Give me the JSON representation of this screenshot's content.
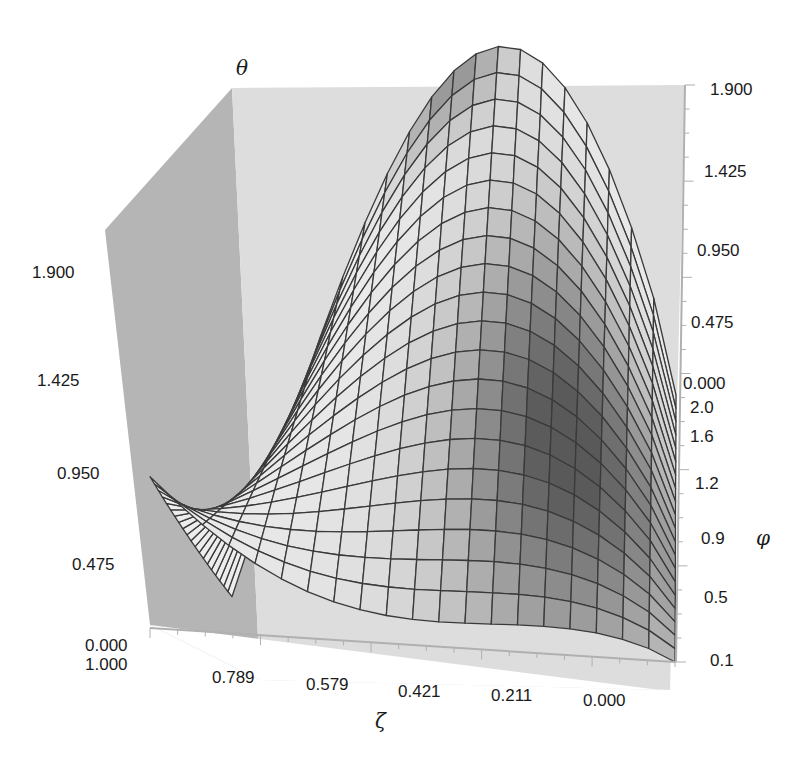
{
  "chart_data": {
    "type": "surface3d",
    "title": "",
    "axes": {
      "x": {
        "label": "ζ",
        "ticks": [
          "1.000",
          "0.789",
          "0.579",
          "0.421",
          "0.211",
          "0.000"
        ],
        "range": [
          1.0,
          0.0
        ]
      },
      "y": {
        "label": "φ",
        "ticks": [
          "0.1",
          "0.5",
          "0.9",
          "1.2",
          "1.6",
          "2.0"
        ],
        "range": [
          0.1,
          2.0
        ]
      },
      "z": {
        "label": "θ",
        "ticks": [
          "0.000",
          "0.475",
          "0.950",
          "1.425",
          "1.900"
        ],
        "range": [
          0.0,
          1.9
        ]
      }
    },
    "surface_description": "θ(ζ, φ) hump: zero-ish at ζ=0, maximum near ζ≈0.5, grows with φ; peak θ≈1.9 at φ=2.0",
    "grid": {
      "zeta_lines": 20,
      "phi_lines": 20
    },
    "sample_values": {
      "phi_2.0": {
        "zeta": [
          0.0,
          0.211,
          0.421,
          0.579,
          0.789,
          1.0
        ],
        "theta": [
          0.0,
          1.2,
          1.85,
          1.85,
          1.2,
          0.0
        ]
      },
      "phi_0.1_edge": {
        "zeta": [
          0.0,
          1.0
        ],
        "theta": [
          0.0,
          1.05
        ]
      }
    },
    "colors": {
      "back_wall": "#d9d9d9",
      "side_wall": "#b3b3b3",
      "grid_line": "#3a3a3a",
      "surface_light": "#ebebeb",
      "surface_dark": "#6e6e6e"
    }
  },
  "labels": {
    "theta": "θ",
    "phi": "φ",
    "zeta": "ζ",
    "z_left_ticks": [
      "1.900",
      "1.425",
      "0.950",
      "0.475",
      "0.000"
    ],
    "z_right_ticks": [
      "1.900",
      "1.425",
      "0.950",
      "0.475",
      "0.000"
    ],
    "phi_ticks": [
      "2.0",
      "1.6",
      "1.2",
      "0.9",
      "0.5",
      "0.1"
    ],
    "zeta_ticks": [
      "1.000",
      "0.789",
      "0.579",
      "0.421",
      "0.211",
      "0.000"
    ]
  }
}
